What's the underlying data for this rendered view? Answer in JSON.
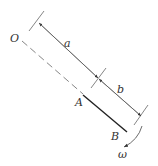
{
  "diagram": {
    "type": "mechanics-rod-rotation",
    "labels": {
      "pivot": "O",
      "point_a": "A",
      "point_b": "B",
      "dim_a": "a",
      "dim_b": "b",
      "angular_velocity": "ω"
    },
    "colors": {
      "line": "#555555",
      "rod": "#222222",
      "text": "#333333",
      "background": "#ffffff"
    }
  }
}
